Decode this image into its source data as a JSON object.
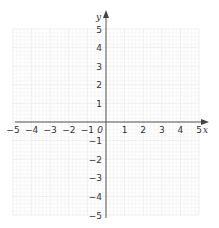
{
  "chart_data": {
    "type": "scatter",
    "title": "",
    "xlabel": "x",
    "ylabel": "y",
    "xlim": [
      -5,
      5
    ],
    "ylim": [
      -5,
      5
    ],
    "grid": true,
    "x_ticks": [
      "−5",
      "−4",
      "−3",
      "−2",
      "−1",
      "0",
      "1",
      "2",
      "3",
      "4",
      "5"
    ],
    "y_ticks": [
      "5",
      "4",
      "3",
      "2",
      "1",
      "−1",
      "−2",
      "−3",
      "−4",
      "−5"
    ],
    "origin_label": "0",
    "series": []
  },
  "colors": {
    "axis": "#555555",
    "grid_major": "#e2e2e2",
    "grid_minor": "#f1f1f1",
    "text": "#333333"
  }
}
